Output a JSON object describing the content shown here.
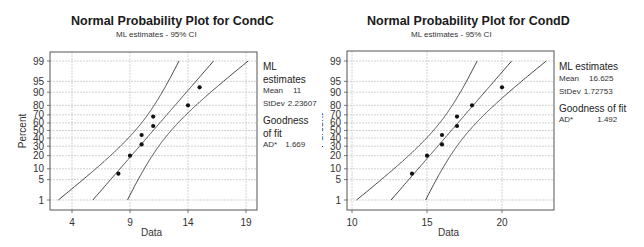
{
  "chart_data": [
    {
      "type": "scatter",
      "title": "Normal Probability Plot for CondC",
      "subtitle": "ML estimates - 95% CI",
      "xlabel": "Data",
      "ylabel": "Percent",
      "x_ticks": [
        4,
        9,
        14,
        19
      ],
      "y_ticks": [
        1,
        5,
        10,
        20,
        30,
        40,
        50,
        60,
        70,
        80,
        90,
        95,
        99
      ],
      "y_tick_labels_shown": [
        1,
        5,
        10,
        20,
        30,
        40,
        50,
        60,
        70,
        80,
        90,
        95,
        99
      ],
      "xlim": [
        2.1,
        20.0
      ],
      "ylim_percent": [
        0.4,
        99.6
      ],
      "grid": true,
      "points": [
        {
          "x": 8,
          "percent": 7.4
        },
        {
          "x": 9,
          "percent": 20
        },
        {
          "x": 10,
          "percent": 32
        },
        {
          "x": 10,
          "percent": 44
        },
        {
          "x": 11,
          "percent": 56
        },
        {
          "x": 11,
          "percent": 68
        },
        {
          "x": 14,
          "percent": 80
        },
        {
          "x": 15,
          "percent": 92.6
        }
      ],
      "fit": {
        "mean": 11,
        "stdev": 2.23607
      },
      "ci_level": 0.95,
      "n": 8,
      "legend": {
        "header": "ML estimates",
        "rows": [
          {
            "label": "Mean",
            "value": "11"
          },
          {
            "label": "StDev",
            "value": "2.23607"
          }
        ],
        "gof_header_lines": [
          "Goodness",
          "of fit"
        ],
        "gof_rows": [
          {
            "label": "AD*",
            "value": "1.669"
          }
        ]
      }
    },
    {
      "type": "scatter",
      "title": "Normal Probability Plot for CondD",
      "subtitle": "ML estimates - 95% CI",
      "xlabel": "Data",
      "ylabel": "Percent",
      "x_ticks": [
        10,
        15,
        20
      ],
      "y_ticks": [
        1,
        5,
        10,
        20,
        30,
        40,
        50,
        60,
        70,
        80,
        90,
        95,
        99
      ],
      "xlim": [
        9.7,
        23.5
      ],
      "ylim_percent": [
        0.4,
        99.6
      ],
      "grid": true,
      "points": [
        {
          "x": 14,
          "percent": 7.4
        },
        {
          "x": 15,
          "percent": 20
        },
        {
          "x": 16,
          "percent": 32
        },
        {
          "x": 16,
          "percent": 44
        },
        {
          "x": 17,
          "percent": 56
        },
        {
          "x": 17,
          "percent": 68
        },
        {
          "x": 18,
          "percent": 80
        },
        {
          "x": 20,
          "percent": 92.6
        }
      ],
      "fit": {
        "mean": 16.625,
        "stdev": 1.72753
      },
      "ci_level": 0.95,
      "n": 8,
      "legend": {
        "header": "ML estimates",
        "rows": [
          {
            "label": "Mean",
            "value": "16.625"
          },
          {
            "label": "StDev",
            "value": "1.72753"
          }
        ],
        "gof_header_lines": [
          "Goodness of fit"
        ],
        "gof_rows": [
          {
            "label": "AD*",
            "value": "1.492"
          }
        ]
      }
    }
  ],
  "colors": {
    "frame": "#555555",
    "grid": "#c8c8c8",
    "line": "#333333",
    "point": "#111111"
  }
}
